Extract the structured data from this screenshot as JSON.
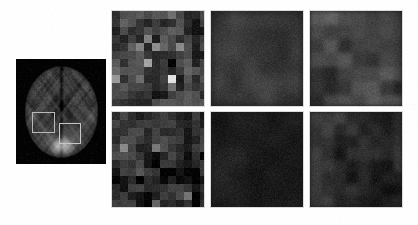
{
  "figure": {
    "background_color": "#fdfdfd"
  },
  "brain_panel": {
    "label": "axial-brain-mri",
    "background_color": "#000000",
    "modality": "MRI axial slice",
    "rois": [
      {
        "name": "roi-box-left",
        "x_pct": 18,
        "y_pct": 50,
        "w_pct": 24,
        "h_pct": 19,
        "stroke_color": "#b9b9b9"
      },
      {
        "name": "roi-box-right",
        "x_pct": 48,
        "y_pct": 61,
        "w_pct": 23,
        "h_pct": 19,
        "stroke_color": "#c6c6c6"
      }
    ]
  },
  "tile_grid": {
    "rows": 2,
    "columns": 3,
    "border_color": "#bebebe",
    "tiles": [
      {
        "name": "tile-row1-col1",
        "style": "pixelated",
        "block_size": 8,
        "mean_level": 62,
        "contrast": 58,
        "seed": 101
      },
      {
        "name": "tile-row1-col2",
        "style": "smooth",
        "block_size": 16,
        "mean_level": 58,
        "contrast": 26,
        "seed": 202
      },
      {
        "name": "tile-row1-col3",
        "style": "blocky",
        "block_size": 14,
        "mean_level": 60,
        "contrast": 40,
        "seed": 303
      },
      {
        "name": "tile-row2-col1",
        "style": "pixelated",
        "block_size": 8,
        "mean_level": 42,
        "contrast": 48,
        "seed": 404
      },
      {
        "name": "tile-row2-col2",
        "style": "smooth",
        "block_size": 18,
        "mean_level": 26,
        "contrast": 16,
        "seed": 505
      },
      {
        "name": "tile-row2-col3",
        "style": "blocky",
        "block_size": 12,
        "mean_level": 38,
        "contrast": 30,
        "seed": 606
      }
    ]
  },
  "chart_data": {
    "type": "heatmap",
    "xlabel": "",
    "ylabel": "",
    "grid": false,
    "legend_position": "none",
    "panels": [
      {
        "row": 1,
        "col": 1,
        "label": "row1-col1",
        "mean_intensity": 62,
        "std_intensity": 58
      },
      {
        "row": 1,
        "col": 2,
        "label": "row1-col2",
        "mean_intensity": 58,
        "std_intensity": 26
      },
      {
        "row": 1,
        "col": 3,
        "label": "row1-col3",
        "mean_intensity": 60,
        "std_intensity": 40
      },
      {
        "row": 2,
        "col": 1,
        "label": "row2-col1",
        "mean_intensity": 42,
        "std_intensity": 48
      },
      {
        "row": 2,
        "col": 2,
        "label": "row2-col2",
        "mean_intensity": 26,
        "std_intensity": 16
      },
      {
        "row": 2,
        "col": 3,
        "label": "row2-col3",
        "mean_intensity": 38,
        "std_intensity": 30
      }
    ],
    "colormap": "gray",
    "value_range": [
      0,
      255
    ]
  }
}
